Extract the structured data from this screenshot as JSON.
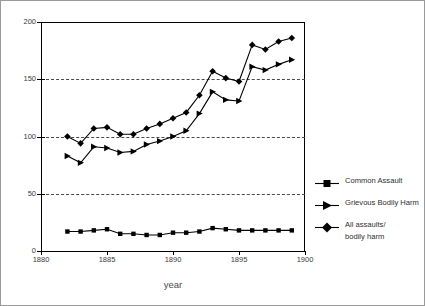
{
  "chart_data": {
    "type": "line",
    "title": "",
    "xlabel": "year",
    "ylabel": "",
    "xlim": [
      1880,
      1900
    ],
    "ylim": [
      0,
      200
    ],
    "xticks": [
      1880,
      1885,
      1890,
      1895,
      1900
    ],
    "yticks": [
      0,
      50,
      100,
      150,
      200
    ],
    "grid": true,
    "grid_axis": "y",
    "legend_position": "right",
    "x": [
      1882,
      1883,
      1884,
      1885,
      1886,
      1887,
      1888,
      1889,
      1890,
      1891,
      1892,
      1893,
      1894,
      1895,
      1896,
      1897,
      1898,
      1899
    ],
    "series": [
      {
        "name": "Common Assault",
        "marker": "square",
        "values": [
          17,
          17,
          18,
          19,
          15,
          15,
          14,
          14,
          16,
          16,
          17,
          20,
          19,
          18,
          18,
          18,
          18,
          18
        ]
      },
      {
        "name": "Grievous Bodily Harm",
        "marker": "triangle-right",
        "values": [
          83,
          77,
          91,
          90,
          86,
          87,
          93,
          96,
          100,
          105,
          120,
          139,
          132,
          131,
          161,
          158,
          163,
          167
        ]
      },
      {
        "name": "All assaults/ bodily harm",
        "marker": "diamond",
        "values": [
          100,
          94,
          107,
          108,
          102,
          102,
          107,
          111,
          116,
          121,
          136,
          157,
          151,
          148,
          180,
          176,
          183,
          186
        ]
      }
    ]
  },
  "axis": {
    "x_title": "year",
    "x_tick_labels": [
      "1880",
      "1885",
      "1890",
      "1895",
      "1900"
    ],
    "y_tick_labels": [
      "0",
      "50",
      "100",
      "150",
      "200"
    ]
  },
  "legend": {
    "items": [
      {
        "label": "Common Assault",
        "label2": "",
        "marker": "square"
      },
      {
        "label": "Grievous Bodily Harm",
        "label2": "",
        "marker": "triangle-right"
      },
      {
        "label": "All assaults/",
        "label2": "bodily harm",
        "marker": "diamond"
      }
    ]
  }
}
